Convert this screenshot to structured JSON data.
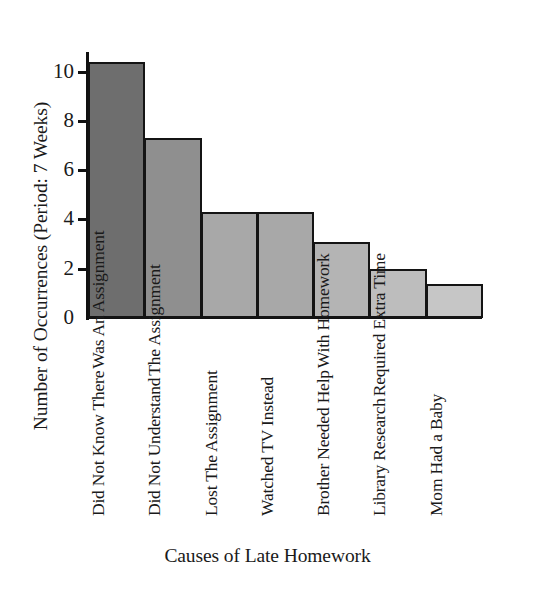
{
  "chart_data": {
    "type": "bar",
    "title": "",
    "xlabel": "Causes of Late Homework",
    "ylabel": "Number of Occurrences (Period: 7 Weeks)",
    "categories": [
      "Did Not Know There Was An Assignment",
      "Did Not Understand The Assignment",
      "Lost The Assignment",
      "Watched TV Instead",
      "Brother Needed Help With Homework",
      "Library Research Required Extra Time",
      "Mom Had a Baby"
    ],
    "category_lines": [
      [
        "Did Not Know There",
        "Was An Assignment"
      ],
      [
        "Did Not Understand",
        "The Assignment"
      ],
      [
        "Lost The Assignment"
      ],
      [
        "Watched TV Instead"
      ],
      [
        "Brother Needed Help",
        "With Homework"
      ],
      [
        "Library Research",
        "Required Extra Time"
      ],
      [
        "Mom Had a Baby"
      ]
    ],
    "values": [
      10.4,
      7.3,
      4.3,
      4.3,
      3.1,
      2.0,
      1.4
    ],
    "ylim": [
      0,
      10.8
    ],
    "yticks": [
      0,
      2,
      4,
      6,
      8,
      10
    ],
    "ytick_labels": [
      "0",
      "2",
      "4",
      "6",
      "8",
      "10"
    ],
    "grid": false,
    "legend": "none",
    "bar_fill_shades": [
      "#6e6e6e",
      "#8f8f8f",
      "#a8a8a8",
      "#a8a8a8",
      "#b4b4b4",
      "#bdbdbd",
      "#c6c6c6"
    ],
    "bar_edge_color": "#141414",
    "axis_color": "#111111",
    "background": "#ffffff"
  }
}
